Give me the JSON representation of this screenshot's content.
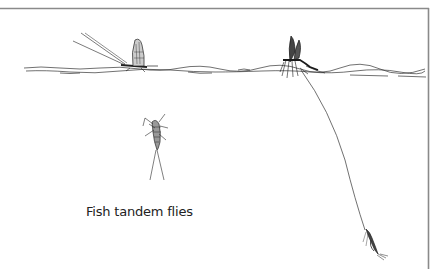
{
  "illustration": {
    "caption": "Fish tandem flies",
    "subjects": [
      "dry-fly-dun-left",
      "dry-fly-dun-right",
      "emerging-nymph",
      "dropper-nymph-fly",
      "tippet-line",
      "water-surface"
    ],
    "colors": {
      "ink": "#222222",
      "frame": "#8a8a8a",
      "background": "#ffffff"
    }
  }
}
